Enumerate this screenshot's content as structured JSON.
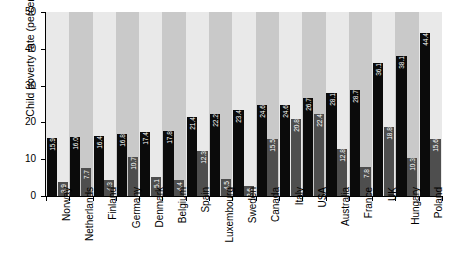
{
  "chart_data": {
    "type": "bar",
    "title": "",
    "xlabel": "",
    "ylabel": "Child poverty rate (percent)",
    "ylim": [
      0,
      50
    ],
    "yticks": [
      0,
      10,
      20,
      30,
      40,
      50
    ],
    "ytick_labels": [
      "0",
      "10",
      "20",
      "30",
      "40",
      "50"
    ],
    "grid": false,
    "legend": "none",
    "categories": [
      "Norway",
      "Netherlands",
      "Finland",
      "Germany",
      "Denmark",
      "Belgium",
      "Spain",
      "Luxembourg",
      "Sweden",
      "Canada",
      "Italy",
      "USA",
      "Australia",
      "France",
      "UK",
      "Hungary",
      "Poland"
    ],
    "series": [
      {
        "name": "before taxes and transfers",
        "color": "#0b0b0b",
        "values": [
          15.9,
          16.0,
          16.4,
          16.8,
          17.4,
          17.8,
          21.4,
          22.2,
          23.4,
          24.6,
          24.6,
          26.7,
          28.1,
          28.7,
          36.1,
          38.1,
          44.4
        ],
        "labels": [
          "15.9",
          "16.0",
          "16.4",
          "16.8",
          "17.4",
          "17.8",
          "21.4",
          "22.2",
          "23.4",
          "24.6",
          "24.6",
          "26.7",
          "28.1",
          "28.7",
          "36.1",
          "38.1",
          "44.4"
        ]
      },
      {
        "name": "after taxes and transfers",
        "color": "#4e4e4e",
        "values": [
          3.9,
          7.7,
          4.3,
          10.7,
          5.1,
          4.4,
          12.3,
          4.5,
          2.6,
          15.5,
          20.8,
          22.4,
          12.8,
          7.8,
          18.8,
          10.3,
          15.6
        ],
        "labels": [
          "3.9",
          "7.7",
          "4.3",
          "10.7",
          "5.1",
          "4.4",
          "12.3",
          "4.5",
          "2.6",
          "15.5",
          "20.8",
          "22.4",
          "12.8",
          "7.8",
          "18.8",
          "10.3",
          "15.6"
        ]
      }
    ],
    "band_colors": [
      "#e9e9e9",
      "#c9c9c9"
    ]
  }
}
